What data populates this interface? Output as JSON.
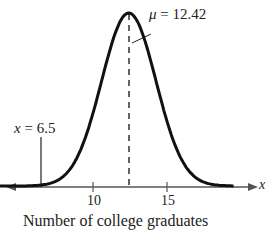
{
  "chart_data": {
    "type": "line",
    "title": "",
    "subtitle": "Normal distribution curve",
    "xlabel": "Number of college graduates",
    "ylabel": "",
    "x_axis_symbol": "x",
    "xticks": [
      10,
      15
    ],
    "xlim": [
      3,
      20
    ],
    "grid": false,
    "legend": "none",
    "mean": 12.42,
    "annotations": [
      {
        "text": "μ = 12.42",
        "x": 12.42,
        "style": "dashed vertical line at mean"
      },
      {
        "text": "x = 6.5",
        "x": 6.5,
        "style": "solid vertical line"
      }
    ],
    "series": [
      {
        "name": "normal curve",
        "mean": 12.42,
        "approx_sd": 1.84
      }
    ]
  },
  "labels": {
    "mu_symbol": "μ",
    "mu_text": " = 12.42",
    "x_symbol": "x",
    "x_text": " = 6.5",
    "tick_10": "10",
    "tick_15": "15",
    "axis_var": "x",
    "xlabel": "Number of college graduates"
  }
}
